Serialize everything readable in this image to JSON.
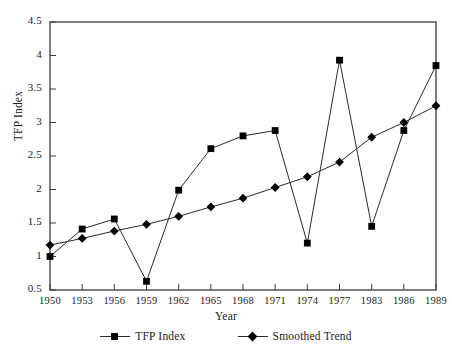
{
  "chart_data": {
    "type": "line",
    "title": "",
    "xlabel": "Year",
    "ylabel": "TFP Index",
    "x": [
      1950,
      1953,
      1956,
      1959,
      1962,
      1965,
      1968,
      1971,
      1974,
      1977,
      1983,
      1986,
      1989
    ],
    "categories": [
      "1950",
      "1953",
      "1956",
      "1959",
      "1962",
      "1965",
      "1968",
      "1971",
      "1974",
      "1977",
      "1983",
      "1986",
      "1989"
    ],
    "series": [
      {
        "name": "TFP Index",
        "marker": "square",
        "values": [
          1.0,
          1.41,
          1.56,
          0.63,
          1.99,
          2.61,
          2.8,
          2.88,
          1.2,
          3.93,
          1.45,
          2.88,
          3.85
        ]
      },
      {
        "name": "Smoothed Trend",
        "marker": "diamond",
        "values": [
          1.17,
          1.27,
          1.38,
          1.48,
          1.6,
          1.74,
          1.87,
          2.03,
          2.19,
          2.41,
          2.78,
          3.0,
          3.25
        ]
      }
    ],
    "ylim": [
      0.5,
      4.5
    ],
    "ytick_labels": [
      "0.5",
      "1",
      "1.5",
      "2",
      "2.5",
      "3",
      "3.5",
      "4",
      "4.5"
    ],
    "ytick_values": [
      0.5,
      1,
      1.5,
      2,
      2.5,
      3,
      3.5,
      4,
      4.5
    ],
    "grid": false,
    "legend_position": "bottom",
    "line_color": "#2a2a2a",
    "marker_color": "#000000",
    "axis_color": "#3a3a3a",
    "background": "#ffffff"
  }
}
